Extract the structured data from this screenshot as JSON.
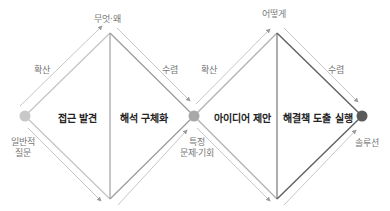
{
  "diagram": {
    "type": "double-diamond",
    "colors": {
      "start_dot": "#c8c8c8",
      "mid_dot": "#a8a8a8",
      "end_dot": "#5a5a5a",
      "line_light": "#bdbdbd",
      "line_mid": "#8f8f8f",
      "line_dark": "#555555",
      "arrow": "#9a9a9a"
    },
    "nodes": {
      "start": {
        "label_line1": "일반적",
        "label_line2": "질문"
      },
      "middle": {
        "label_line1": "특정",
        "label_line2": "문제·기회"
      },
      "end": {
        "label": "솔루션"
      }
    },
    "diamonds": [
      {
        "top_label": "무엇·왜",
        "diverge_label": "확산",
        "converge_label": "수렴",
        "phases": [
          "접근 발견",
          "해석 구체화"
        ]
      },
      {
        "top_label": "어떻게",
        "diverge_label": "확산",
        "converge_label": "수렴",
        "phases": [
          "아이디어 제안",
          "해결책 도출 실행"
        ]
      }
    ]
  }
}
